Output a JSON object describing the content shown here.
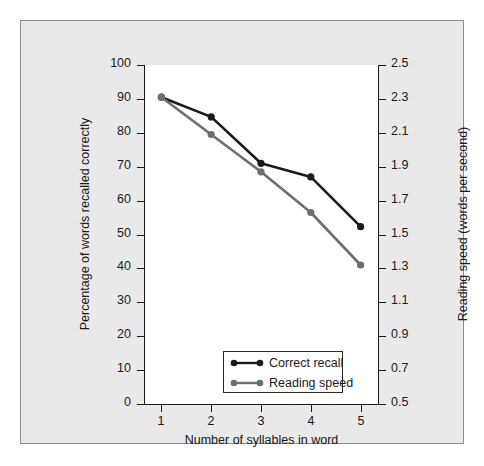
{
  "chart_data": {
    "type": "line",
    "title": "",
    "xlabel": "Number of syllables in word",
    "ylabel": "Percentage of words recalled correctly",
    "y2label": "Reading speed (words per second)",
    "x": [
      1,
      2,
      3,
      4,
      5
    ],
    "xticklabels": [
      "1",
      "2",
      "3",
      "4",
      "5"
    ],
    "xlim": [
      0.65,
      5.35
    ],
    "ylim": [
      0,
      100
    ],
    "yticks": [
      0,
      10,
      20,
      30,
      40,
      50,
      60,
      70,
      80,
      90,
      100
    ],
    "yticklabels": [
      "0",
      "10",
      "20",
      "30",
      "40",
      "50",
      "60",
      "70",
      "80",
      "90",
      "100"
    ],
    "y2lim": [
      0.5,
      2.5
    ],
    "y2ticks": [
      0.5,
      0.7,
      0.9,
      1.1,
      1.3,
      1.5,
      1.7,
      1.9,
      2.1,
      2.3,
      2.5
    ],
    "y2ticklabels": [
      "0.5",
      "0.7",
      "0.9",
      "1.1",
      "1.3",
      "1.5",
      "1.7",
      "1.9",
      "2.1",
      "2.3",
      "2.5"
    ],
    "grid": false,
    "legend_position": "lower center",
    "series": [
      {
        "name": "Correct recall",
        "axis": "left",
        "color": "#1a1a1a",
        "marker": "circle",
        "values": [
          90.5,
          84.7,
          71.0,
          67.0,
          52.3
        ]
      },
      {
        "name": "Reading speed",
        "axis": "right",
        "color": "#6e6e6e",
        "marker": "circle",
        "values": [
          2.31,
          2.09,
          1.87,
          1.63,
          1.32
        ],
        "values_in_left_scale": [
          90.5,
          79.5,
          68.5,
          56.5,
          41.0
        ]
      }
    ]
  },
  "legend": {
    "entries": [
      {
        "label": "Correct recall",
        "color": "#1a1a1a"
      },
      {
        "label": "Reading speed",
        "color": "#6e6e6e"
      }
    ]
  },
  "colors": {
    "panel_background": "#e9e9e9",
    "plot_background": "#ffffff",
    "panel_border": "#8d8d8d",
    "axis": "#1a1a1a",
    "series_correct_recall": "#1a1a1a",
    "series_reading_speed": "#6e6e6e"
  }
}
